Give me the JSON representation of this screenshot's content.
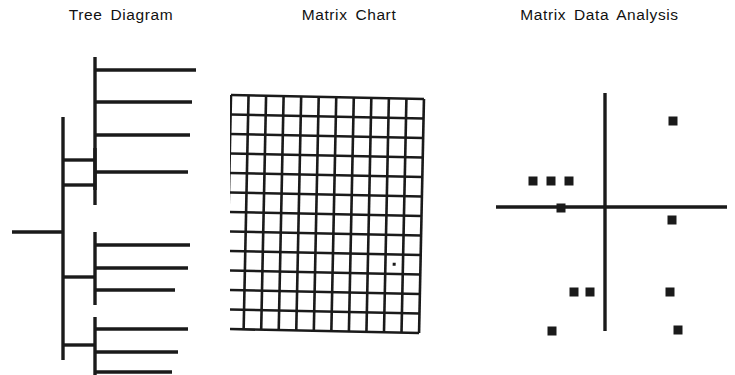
{
  "page": {
    "background": "#ffffff",
    "ink": "#1a1a1a",
    "width": 735,
    "height": 375
  },
  "panels": [
    {
      "id": "tree",
      "title": "Tree Diagram"
    },
    {
      "id": "matrix",
      "title": "Matrix Chart"
    },
    {
      "id": "scatter",
      "title": "Matrix Data Analysis"
    }
  ],
  "chart_data": [
    {
      "type": "tree",
      "title": "Tree Diagram",
      "orientation": "horizontal-right",
      "root": {
        "x": 12,
        "y": 232,
        "stem_end_x": 63
      },
      "trunk": {
        "x": 63,
        "y_top": 117,
        "y_bottom": 360
      },
      "clusters": [
        {
          "x": 95,
          "y_top": 57,
          "y_bottom": 190,
          "join_y": 160,
          "leaves": [
            {
              "y": 70,
              "x_end": 196
            },
            {
              "y": 102,
              "x_end": 192
            },
            {
              "y": 135,
              "x_end": 190
            },
            {
              "y": 172,
              "x_end": 188
            }
          ]
        },
        {
          "x": 95,
          "y_top": 148,
          "y_bottom": 205,
          "join_y": 185,
          "leaves": []
        },
        {
          "x": 95,
          "y_top": 232,
          "y_bottom": 305,
          "join_y": 277,
          "leaves": [
            {
              "y": 245,
              "x_end": 190
            },
            {
              "y": 268,
              "x_end": 188
            },
            {
              "y": 290,
              "x_end": 175
            }
          ]
        },
        {
          "x": 95,
          "y_top": 317,
          "y_bottom": 375,
          "join_y": 345,
          "leaves": [
            {
              "y": 329,
              "x_end": 188
            },
            {
              "y": 352,
              "x_end": 178
            },
            {
              "y": 372,
              "x_end": 172
            }
          ]
        }
      ],
      "leaf_count": 10,
      "xlabel": "",
      "ylabel": "",
      "grid": false,
      "legend": null
    },
    {
      "type": "heatmap",
      "title": "Matrix Chart",
      "grid": true,
      "columns": 11,
      "rows": 12,
      "bounds": {
        "x": 231,
        "y": 95,
        "width": 193,
        "height": 234
      },
      "skew_deg": 1.2,
      "cells": [],
      "marks": [
        {
          "col": 9,
          "row": 8,
          "x": 388,
          "y": 242,
          "size": 3
        }
      ],
      "xlabel": "",
      "ylabel": "",
      "legend": null
    },
    {
      "type": "scatter",
      "title": "Matrix Data Analysis",
      "grid": false,
      "legend": null,
      "xlabel": "",
      "ylabel": "",
      "axes": {
        "vertical": {
          "x": 605,
          "y_top": 93,
          "y_bottom": 331
        },
        "horizontal": {
          "y": 207,
          "x_left": 496,
          "x_right": 727
        }
      },
      "origin": {
        "x": 605,
        "y": 207
      },
      "marker": {
        "shape": "square",
        "size": 9,
        "color": "#1a1a1a"
      },
      "points": [
        {
          "x": 673,
          "y": 121,
          "quadrant": "upper-right"
        },
        {
          "x": 533,
          "y": 181,
          "quadrant": "upper-left"
        },
        {
          "x": 551,
          "y": 181,
          "quadrant": "upper-left"
        },
        {
          "x": 569,
          "y": 181,
          "quadrant": "upper-left"
        },
        {
          "x": 561,
          "y": 208,
          "quadrant": "on-x-axis"
        },
        {
          "x": 672,
          "y": 220,
          "quadrant": "lower-right"
        },
        {
          "x": 574,
          "y": 292,
          "quadrant": "lower-left"
        },
        {
          "x": 590,
          "y": 292,
          "quadrant": "lower-left"
        },
        {
          "x": 670,
          "y": 292,
          "quadrant": "lower-right"
        },
        {
          "x": 552,
          "y": 331,
          "quadrant": "lower-left"
        },
        {
          "x": 678,
          "y": 330,
          "quadrant": "lower-right"
        }
      ]
    }
  ]
}
